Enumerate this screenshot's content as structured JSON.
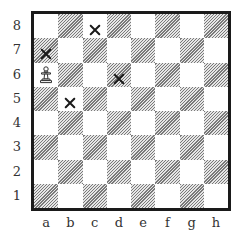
{
  "diagram": {
    "type": "chessboard",
    "files": [
      "a",
      "b",
      "c",
      "d",
      "e",
      "f",
      "g",
      "h"
    ],
    "ranks": [
      "8",
      "7",
      "6",
      "5",
      "4",
      "3",
      "2",
      "1"
    ],
    "light_square_color": "#ffffff",
    "dark_square_style": "diagonal-hatch",
    "border_color": "#1a1a1a",
    "pieces": [
      {
        "square": "a6",
        "piece": "pawn",
        "color": "white",
        "icon": "white-pawn-icon"
      }
    ],
    "markers": [
      {
        "square": "c8",
        "symbol": "x"
      },
      {
        "square": "a7",
        "symbol": "x"
      },
      {
        "square": "d6",
        "symbol": "x"
      },
      {
        "square": "b5",
        "symbol": "x"
      }
    ]
  }
}
